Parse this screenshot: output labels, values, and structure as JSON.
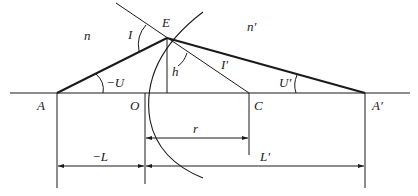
{
  "diagram": {
    "media": {
      "left": "n",
      "right": "n′"
    },
    "points": {
      "A": "A",
      "O": "O",
      "C": "C",
      "A_prime": "A′",
      "E": "E"
    },
    "angles": {
      "incidence": "I",
      "refraction": "I′",
      "object_aperture": "−U",
      "image_aperture": "U′"
    },
    "lengths": {
      "height": "h",
      "radius": "r",
      "object_distance": "−L",
      "image_distance": "L′"
    },
    "colors": {
      "line": "#1a1a1a",
      "background": "#ffffff"
    }
  }
}
